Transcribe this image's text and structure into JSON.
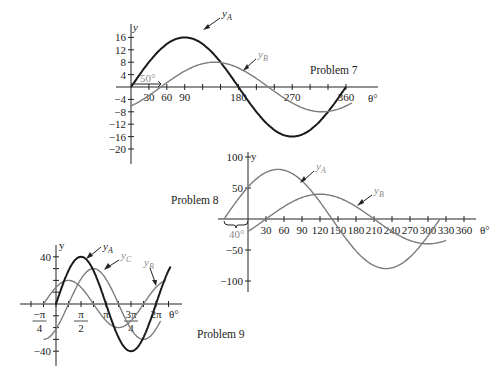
{
  "chart_data": [
    {
      "id": "problem7",
      "type": "line",
      "title": "Problem 7",
      "xlabel": "θ°",
      "ylabel": "y",
      "x_ticks": [
        30,
        60,
        90,
        180,
        270,
        360
      ],
      "x_tick_labels": [
        "30",
        "60",
        "90",
        "180",
        "270",
        "360"
      ],
      "y_ticks": [
        16,
        12,
        8,
        4,
        -4,
        -8,
        -12,
        -16,
        -20
      ],
      "y_tick_labels": [
        "16",
        "12",
        "8",
        "4",
        "−4",
        "−8",
        "−12",
        "−16",
        "−20"
      ],
      "xlim": [
        0,
        380
      ],
      "ylim": [
        -20,
        18
      ],
      "annotation": "50°",
      "series": [
        {
          "name": "yA",
          "label_main": "y",
          "label_sub": "A",
          "amplitude": 16,
          "phase_deg": 0,
          "x_range": [
            0,
            360
          ],
          "style": "dark"
        },
        {
          "name": "yB",
          "label_main": "y",
          "label_sub": "B",
          "amplitude": 8,
          "phase_deg": -50,
          "x_range": [
            0,
            370
          ],
          "style": "gray"
        }
      ]
    },
    {
      "id": "problem8",
      "type": "line",
      "title": "Problem 8",
      "xlabel": "θ°",
      "ylabel": "y",
      "x_ticks": [
        30,
        60,
        90,
        120,
        150,
        180,
        210,
        240,
        270,
        300,
        330,
        360
      ],
      "x_tick_labels": [
        "30",
        "60",
        "90",
        "120",
        "150",
        "180",
        "210",
        "240",
        "270",
        "300",
        "330",
        "360"
      ],
      "y_ticks": [
        100,
        50,
        -50,
        -100
      ],
      "y_tick_labels": [
        "100",
        "50",
        "−50",
        "−100"
      ],
      "xlim": [
        -40,
        380
      ],
      "ylim": [
        -100,
        100
      ],
      "annotation": "40°",
      "series": [
        {
          "name": "yA",
          "label_main": "y",
          "label_sub": "A",
          "amplitude": 80,
          "phase_deg": 40,
          "x_range": [
            -40,
            320
          ],
          "style": "gray"
        },
        {
          "name": "yB",
          "label_main": "y",
          "label_sub": "B",
          "amplitude": 40,
          "phase_deg": -30,
          "x_range": [
            0,
            330
          ],
          "style": "gray"
        }
      ]
    },
    {
      "id": "problem9",
      "type": "line",
      "title": "Problem 9",
      "xlabel": "θ°",
      "ylabel": "y",
      "x_ticks": [
        "-π/4",
        "π/2",
        "π",
        "3π/4",
        "2π"
      ],
      "x_tick_labels": [
        "−π/4",
        "π/2",
        "π",
        "3π/4",
        "2π"
      ],
      "y_ticks": [
        40,
        -40
      ],
      "y_tick_labels": [
        "40",
        "−40"
      ],
      "xlim": [
        "-π/4",
        "2.3π"
      ],
      "ylim": [
        -40,
        40
      ],
      "series": [
        {
          "name": "yA",
          "label_main": "y",
          "label_sub": "A",
          "amplitude": 40,
          "phase_rad": 0,
          "x_range_pi": [
            0,
            2.3
          ],
          "style": "dark"
        },
        {
          "name": "yB",
          "label_main": "y",
          "label_sub": "B",
          "amplitude": 20,
          "phase_rad": 0.7854,
          "x_range_pi": [
            -0.25,
            2.2
          ],
          "style": "gray"
        },
        {
          "name": "yC",
          "label_main": "y",
          "label_sub": "C",
          "amplitude": 30,
          "phase_rad": -0.7854,
          "x_range_pi": [
            -0.25,
            2.1
          ],
          "style": "gray"
        }
      ]
    }
  ],
  "labels": {
    "p7": {
      "title": "Problem 7",
      "y": "y",
      "theta": "θ°",
      "angle": "50°",
      "yA": "y",
      "yA_sub": "A",
      "yB": "y",
      "yB_sub": "B"
    },
    "p8": {
      "title": "Problem 8",
      "y": "y",
      "theta": "θ°",
      "angle": "40°",
      "yA": "y",
      "yA_sub": "A",
      "yB": "y",
      "yB_sub": "B"
    },
    "p9": {
      "title": "Problem 9",
      "y": "y",
      "theta": "θ°",
      "yA": "y",
      "yA_sub": "A",
      "yB": "y",
      "yB_sub": "B",
      "yC": "y",
      "yC_sub": "C"
    }
  }
}
